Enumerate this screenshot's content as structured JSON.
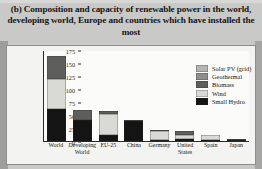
{
  "figure": {
    "label": "(b)",
    "title": "(b) Composition and capacity of renewable power in the world, developing world, Europe and countries which have installed the most"
  },
  "chart_data": {
    "type": "bar",
    "stacked": true,
    "title": "(b) Composition and capacity of renewable power in the world, developing world, Europe and countries which have installed the most",
    "xlabel": "",
    "ylabel": "Gigawatts",
    "ylim": [
      0,
      175
    ],
    "yticks": [
      0,
      25,
      50,
      75,
      100,
      125,
      150,
      175
    ],
    "grid": false,
    "legend_position": "top-right",
    "categories": [
      "World",
      "Developing World",
      "EU-25",
      "China",
      "Germany",
      "United States",
      "Spain",
      "Japan"
    ],
    "series": [
      {
        "name": "Small Hydro",
        "color": "#141414",
        "values": [
          61,
          41,
          11,
          38,
          2,
          3,
          2,
          1
        ]
      },
      {
        "name": "Wind",
        "color": "#d9d9d5",
        "values": [
          59,
          0,
          40,
          0,
          18,
          9,
          10,
          1
        ]
      },
      {
        "name": "Biomass",
        "color": "#5e5e5c",
        "values": [
          43,
          19,
          6,
          2,
          1,
          7,
          0.5,
          1
        ]
      },
      {
        "name": "Geothermal",
        "color": "#8e8e8c",
        "values": [
          0,
          0,
          0,
          0,
          0,
          0,
          0,
          0
        ]
      },
      {
        "name": "Solar PV (grid)",
        "color": "#b4b4b0",
        "values": [
          0,
          0,
          0,
          0,
          0,
          0,
          0,
          0
        ]
      }
    ],
    "totals": [
      163,
      60,
      57,
      40,
      21,
      19,
      12.5,
      3
    ],
    "annotations": []
  },
  "legend": {
    "items": [
      {
        "label": "Solar PV (grid)",
        "color": "#b4b4b0"
      },
      {
        "label": "Geothermal",
        "color": "#8e8e8c"
      },
      {
        "label": "Biomass",
        "color": "#5e5e5c"
      },
      {
        "label": "Wind",
        "color": "#d9d9d5"
      },
      {
        "label": "Small Hydro",
        "color": "#141414"
      }
    ]
  }
}
